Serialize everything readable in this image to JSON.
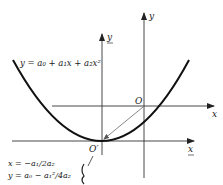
{
  "diagram": {
    "curve_equation": "y = a₀ + a₁x + a₂x²",
    "original_axes": {
      "x_label": "x",
      "y_label": "y",
      "origin_label": "O"
    },
    "shifted_axes": {
      "x_label": "x",
      "y_label": "y",
      "origin_label": "O′",
      "underlined": true
    },
    "vertex_coordinates": {
      "x": "x = −a₁/2a₂",
      "y": "y = a₀ − a₁²/4a₂"
    },
    "arrow": "from O to O′"
  }
}
